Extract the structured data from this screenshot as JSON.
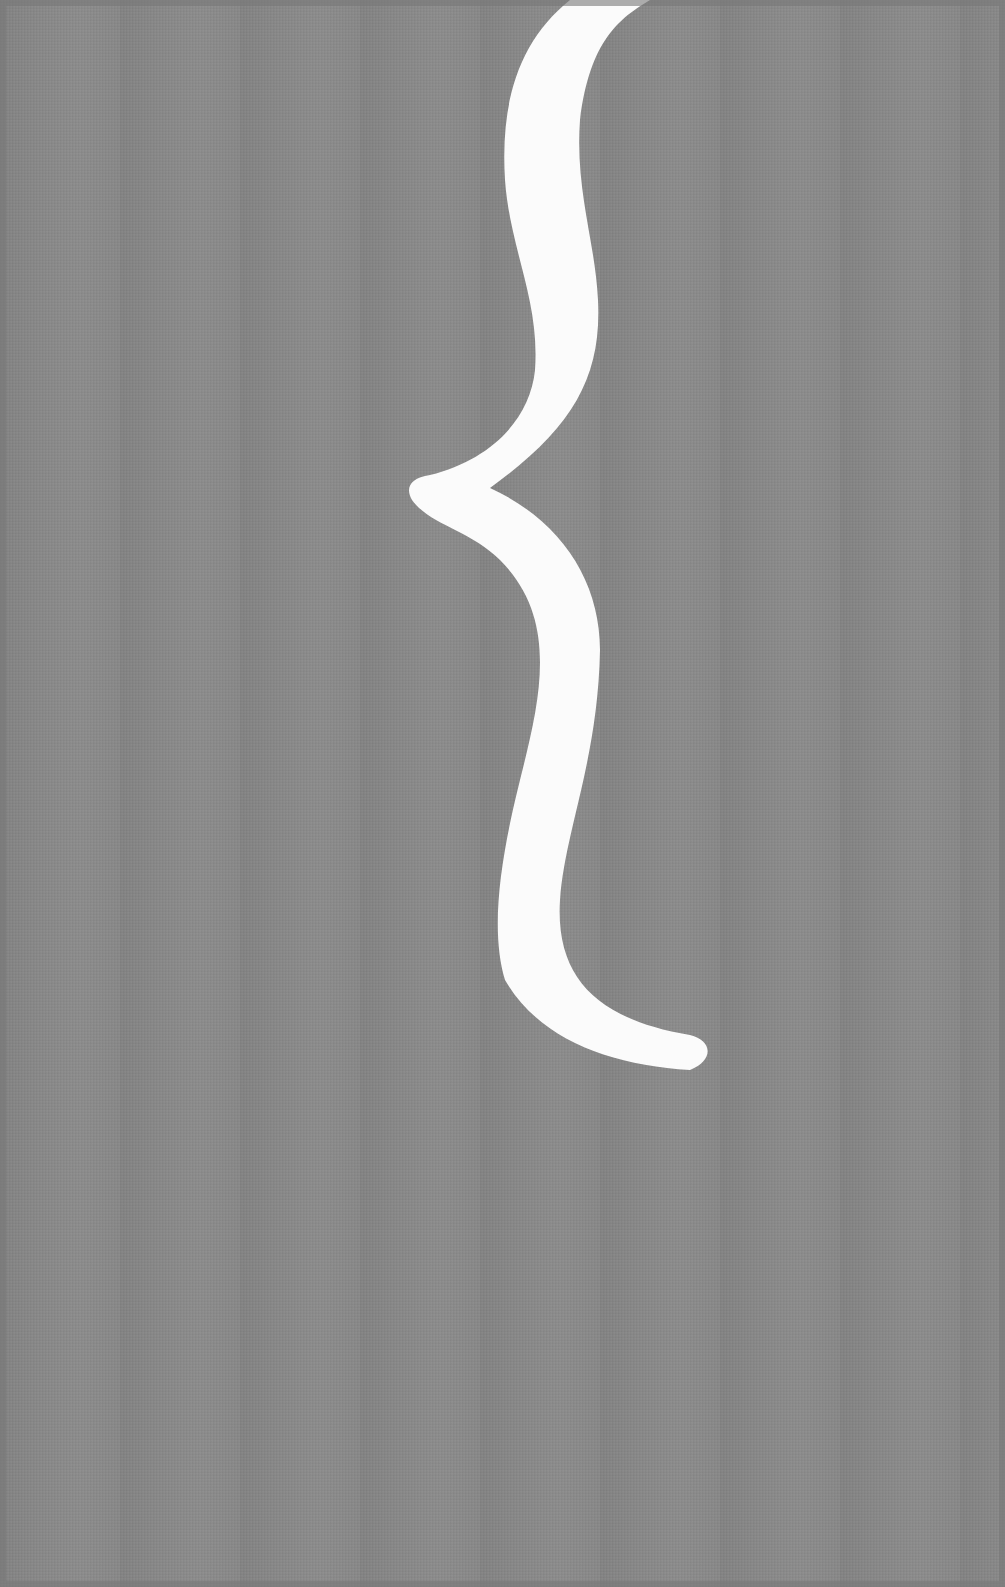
{
  "graphic": {
    "description": "White curly brace on gray fabric-textured background",
    "symbol": "{",
    "background_color": "#8b8b8b",
    "symbol_color": "#fbfbfb"
  }
}
